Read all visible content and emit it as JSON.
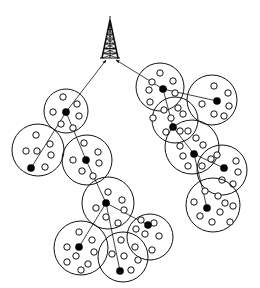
{
  "diagram": {
    "type": "clustered-wireless-sensor-network",
    "colors": {
      "stroke": "#111111",
      "member_fill": "#ffffff",
      "head_fill": "#000000",
      "background": "#ffffff"
    },
    "tower": {
      "x": 110,
      "y": 20,
      "base_y": 58,
      "half_width": 8
    },
    "clusters": [
      {
        "id": "A",
        "cx": 66,
        "cy": 111,
        "r": 22,
        "head": [
          66,
          112
        ],
        "members": [
          [
            63,
            97
          ],
          [
            77,
            104
          ],
          [
            53,
            112
          ],
          [
            79,
            116
          ],
          [
            61,
            124
          ],
          [
            73,
            128
          ]
        ]
      },
      {
        "id": "B",
        "cx": 38,
        "cy": 150,
        "r": 26,
        "head": [
          31,
          168
        ],
        "members": [
          [
            36,
            135
          ],
          [
            26,
            151
          ],
          [
            37,
            151
          ],
          [
            50,
            144
          ],
          [
            51,
            155
          ],
          [
            45,
            167
          ]
        ]
      },
      {
        "id": "C",
        "cx": 87,
        "cy": 160,
        "r": 25,
        "head": [
          86,
          160
        ],
        "members": [
          [
            84,
            143
          ],
          [
            98,
            152
          ],
          [
            73,
            160
          ],
          [
            99,
            163
          ],
          [
            82,
            171
          ],
          [
            93,
            176
          ]
        ]
      },
      {
        "id": "D",
        "cx": 108,
        "cy": 203,
        "r": 26,
        "head": [
          106,
          203
        ],
        "members": [
          [
            108,
            192
          ],
          [
            122,
            200
          ],
          [
            96,
            208
          ],
          [
            106,
            217
          ],
          [
            124,
            210
          ],
          [
            118,
            223
          ]
        ]
      },
      {
        "id": "E",
        "cx": 81,
        "cy": 248,
        "r": 27,
        "head": [
          79,
          247
        ],
        "members": [
          [
            79,
            232
          ],
          [
            67,
            247
          ],
          [
            92,
            240
          ],
          [
            76,
            256
          ],
          [
            94,
            252
          ],
          [
            67,
            262
          ],
          [
            88,
            264
          ],
          [
            81,
            270
          ]
        ]
      },
      {
        "id": "F",
        "cx": 150,
        "cy": 237,
        "r": 23,
        "head": [
          148,
          225
        ],
        "members": [
          [
            141,
            220
          ],
          [
            154,
            223
          ],
          [
            136,
            229
          ],
          [
            145,
            234
          ],
          [
            159,
            236
          ],
          [
            152,
            250
          ]
        ]
      },
      {
        "id": "G",
        "cx": 123,
        "cy": 257,
        "r": 25,
        "head": [
          120,
          271
        ],
        "members": [
          [
            121,
            240
          ],
          [
            135,
            247
          ],
          [
            112,
            254
          ],
          [
            124,
            256
          ],
          [
            138,
            260
          ],
          [
            131,
            270
          ]
        ]
      },
      {
        "id": "H",
        "cx": 160,
        "cy": 87,
        "r": 24,
        "head": [
          163,
          89
        ],
        "members": [
          [
            160,
            73
          ],
          [
            152,
            82
          ],
          [
            173,
            81
          ],
          [
            149,
            90
          ],
          [
            175,
            93
          ],
          [
            150,
            102
          ]
        ]
      },
      {
        "id": "I",
        "cx": 212,
        "cy": 100,
        "r": 25,
        "head": [
          217,
          101
        ],
        "members": [
          [
            214,
            86
          ],
          [
            228,
            93
          ],
          [
            202,
            104
          ],
          [
            229,
            106
          ],
          [
            214,
            114
          ],
          [
            224,
            116
          ]
        ]
      },
      {
        "id": "J",
        "cx": 175,
        "cy": 120,
        "r": 23,
        "head": [
          173,
          127
        ],
        "members": [
          [
            164,
            110
          ],
          [
            178,
            108
          ],
          [
            171,
            118
          ],
          [
            183,
            114
          ],
          [
            153,
            118
          ],
          [
            166,
            132
          ],
          [
            180,
            131
          ],
          [
            188,
            131
          ]
        ]
      },
      {
        "id": "K",
        "cx": 192,
        "cy": 147,
        "r": 27,
        "head": [
          194,
          154
        ],
        "members": [
          [
            196,
            138
          ],
          [
            203,
            145
          ],
          [
            180,
            146
          ],
          [
            183,
            156
          ],
          [
            202,
            166
          ],
          [
            188,
            166
          ]
        ]
      },
      {
        "id": "L",
        "cx": 222,
        "cy": 170,
        "r": 25,
        "head": [
          224,
          168
        ],
        "members": [
          [
            217,
            155
          ],
          [
            236,
            161
          ],
          [
            211,
            159
          ],
          [
            238,
            172
          ],
          [
            222,
            180
          ],
          [
            233,
            184
          ]
        ]
      },
      {
        "id": "M",
        "cx": 213,
        "cy": 205,
        "r": 27,
        "head": [
          207,
          208
        ],
        "members": [
          [
            205,
            191
          ],
          [
            218,
            196
          ],
          [
            194,
            202
          ],
          [
            225,
            203
          ],
          [
            200,
            216
          ],
          [
            220,
            212
          ],
          [
            233,
            206
          ],
          [
            212,
            222
          ],
          [
            230,
            222
          ]
        ]
      }
    ],
    "links": [
      {
        "from": [
          66,
          112
        ],
        "to": [
          106,
          60
        ],
        "arrow": true
      },
      {
        "from": [
          31,
          168
        ],
        "to": [
          66,
          112
        ],
        "arrow": false
      },
      {
        "from": [
          86,
          160
        ],
        "to": [
          66,
          112
        ],
        "arrow": true
      },
      {
        "from": [
          106,
          203
        ],
        "to": [
          86,
          160
        ],
        "arrow": true
      },
      {
        "from": [
          79,
          247
        ],
        "to": [
          106,
          203
        ],
        "arrow": false
      },
      {
        "from": [
          148,
          225
        ],
        "to": [
          106,
          203
        ],
        "arrow": true
      },
      {
        "from": [
          120,
          271
        ],
        "to": [
          106,
          203
        ],
        "arrow": false
      },
      {
        "from": [
          163,
          89
        ],
        "to": [
          116,
          60
        ],
        "arrow": true
      },
      {
        "from": [
          217,
          101
        ],
        "to": [
          163,
          89
        ],
        "arrow": true
      },
      {
        "from": [
          173,
          127
        ],
        "to": [
          163,
          89
        ],
        "arrow": false
      },
      {
        "from": [
          194,
          154
        ],
        "to": [
          173,
          127
        ],
        "arrow": true
      },
      {
        "from": [
          224,
          168
        ],
        "to": [
          194,
          154
        ],
        "arrow": true
      },
      {
        "from": [
          207,
          208
        ],
        "to": [
          194,
          154
        ],
        "arrow": false
      }
    ]
  }
}
